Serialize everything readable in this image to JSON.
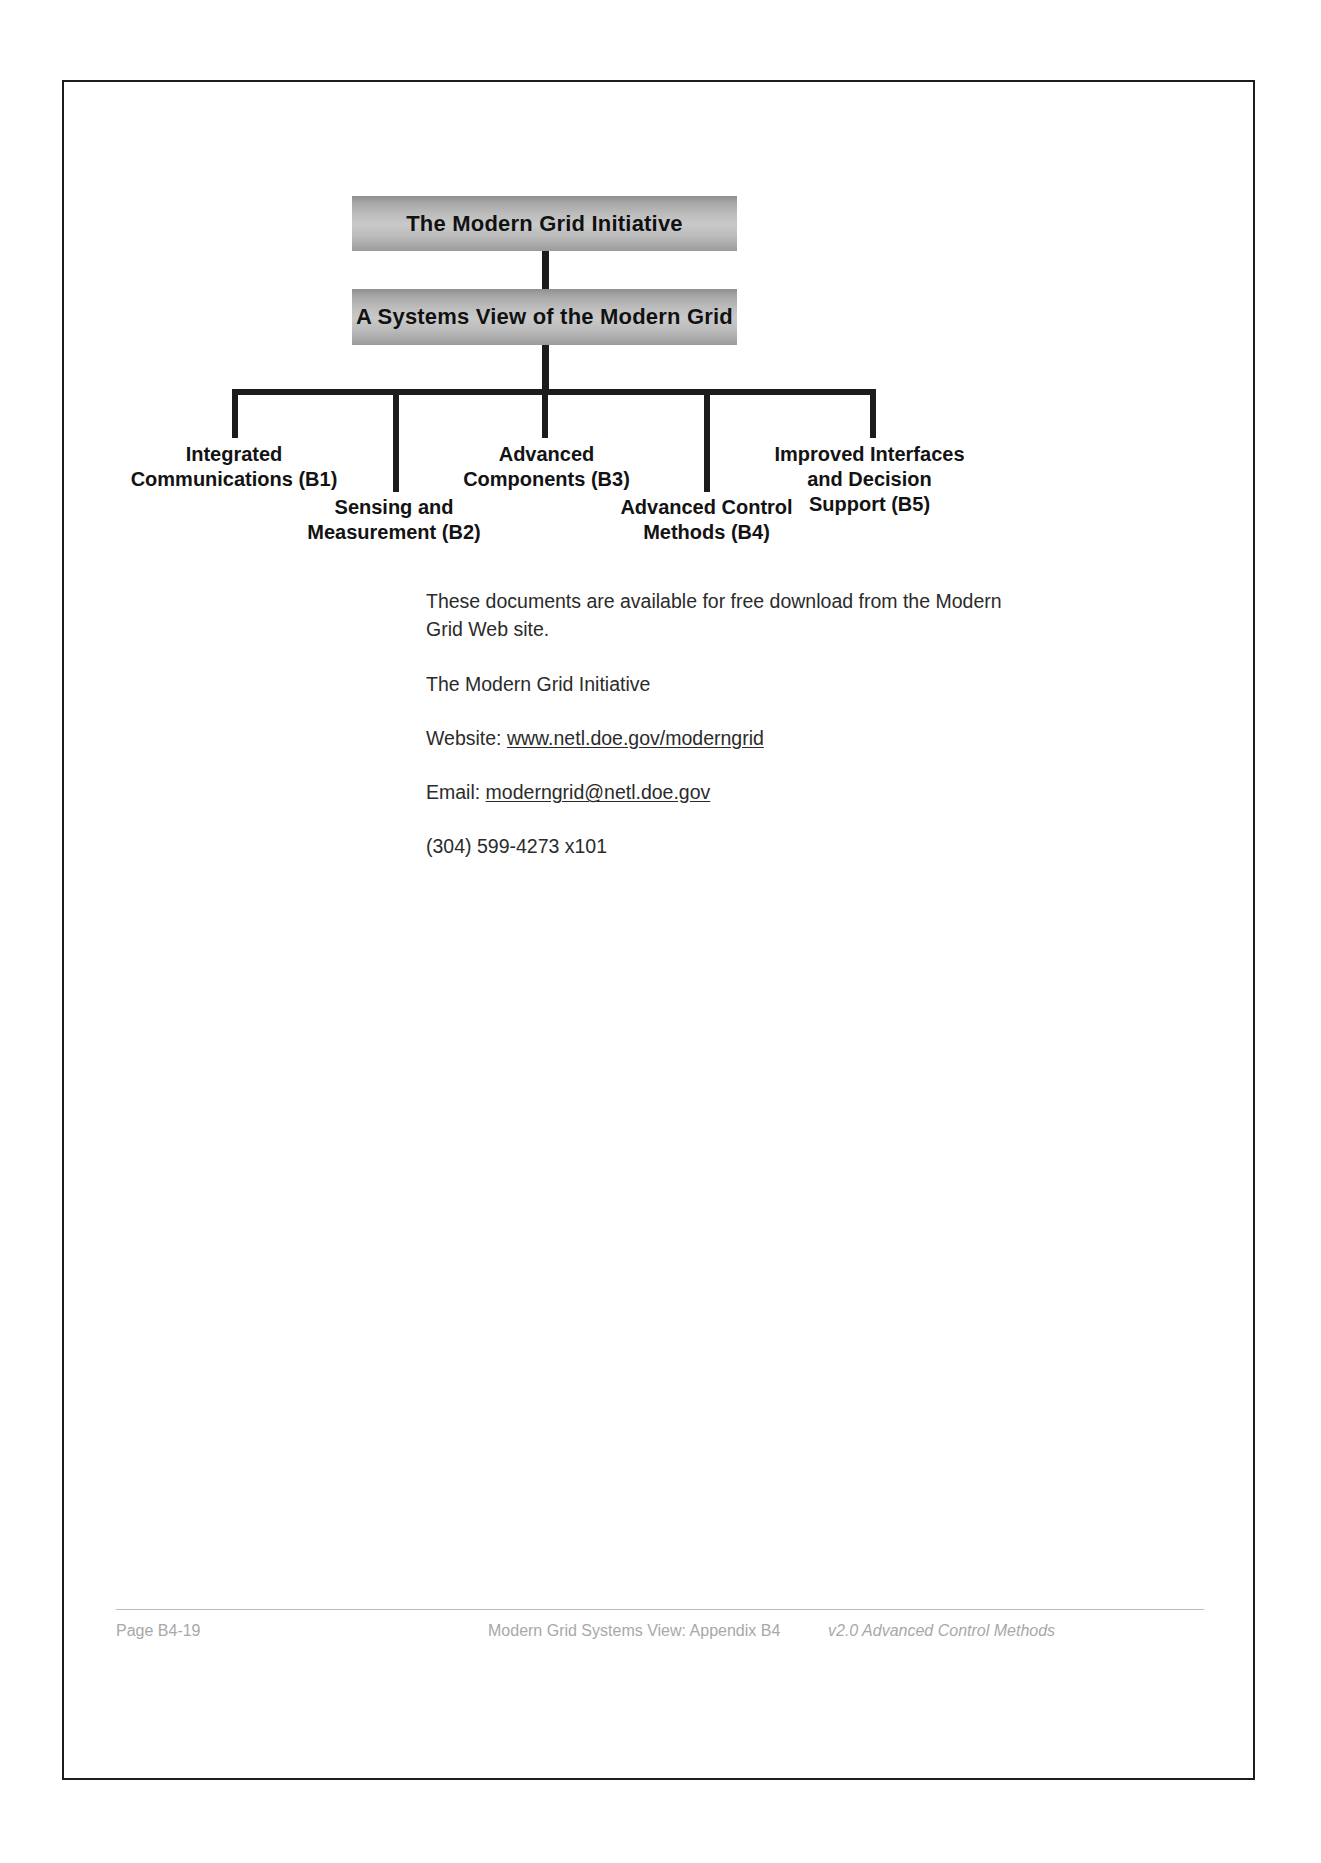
{
  "document": {
    "diagram": {
      "root_node": "The Modern Grid Initiative",
      "second_node": "A Systems View of the Modern Grid",
      "leaves": [
        {
          "id": "B1",
          "label": "Integrated\nCommunications (B1)"
        },
        {
          "id": "B2",
          "label": "Sensing and\nMeasurement (B2)"
        },
        {
          "id": "B3",
          "label": "Advanced\nComponents (B3)"
        },
        {
          "id": "B4",
          "label": "Advanced Control\nMethods (B4)"
        },
        {
          "id": "B5",
          "label": "Improved Interfaces\nand Decision\nSupport (B5)"
        }
      ]
    },
    "body": {
      "intro": "These documents are available for free download from the Modern Grid Web site.",
      "org_name": "The Modern Grid Initiative",
      "website_label": "Website: ",
      "website_url": "www.netl.doe.gov/moderngrid",
      "email_label": "Email: ",
      "email_address": "moderngrid@netl.doe.gov",
      "phone": "(304) 599-4273 x101"
    },
    "footer": {
      "page": "Page B4-19",
      "center": "Modern Grid Systems View:  Appendix B4",
      "right": "v2.0 Advanced Control Methods"
    }
  }
}
